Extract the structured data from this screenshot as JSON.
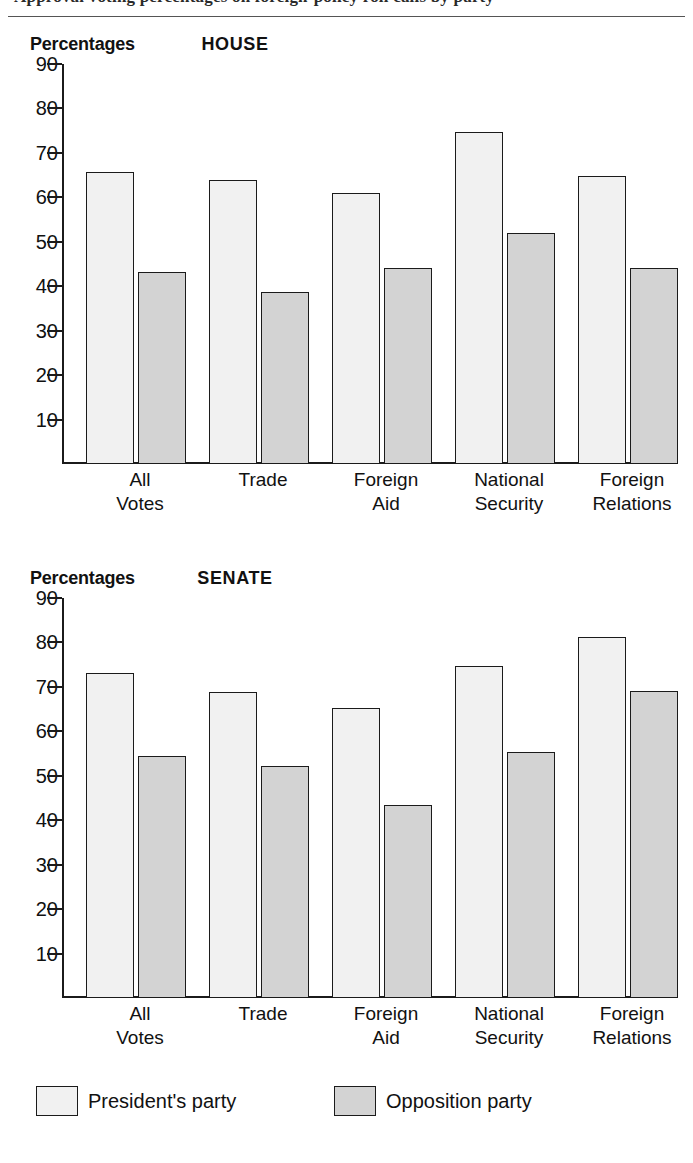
{
  "page": {
    "running_head_partial": "Approval voting percentages on foreign-policy roll calls by party",
    "top_rule": true
  },
  "legend": {
    "items": [
      {
        "key": "president",
        "label": "President's party",
        "color": "#f1f1f1"
      },
      {
        "key": "opposition",
        "label": "Opposition party",
        "color": "#d3d3d3"
      }
    ]
  },
  "axis": {
    "y_title": "Percentages",
    "ticks": [
      90,
      80,
      70,
      60,
      50,
      40,
      30,
      20,
      10
    ],
    "min": 0,
    "max": 90
  },
  "panels": [
    {
      "id": "house",
      "title": "HOUSE",
      "y_title": "Percentages"
    },
    {
      "id": "senate",
      "title": "SENATE",
      "y_title": "Percentages"
    }
  ],
  "chart_data": [
    {
      "type": "bar",
      "title": "HOUSE",
      "xlabel": "",
      "ylabel": "Percentages",
      "ylim": [
        0,
        90
      ],
      "yticks": [
        10,
        20,
        30,
        40,
        50,
        60,
        70,
        80,
        90
      ],
      "grid": false,
      "legend_position": "bottom",
      "categories": [
        "All Votes",
        "Trade",
        "Foreign Aid",
        "National Security",
        "Foreign Relations"
      ],
      "series": [
        {
          "name": "President's party",
          "values": [
            65.7,
            63.8,
            61.0,
            74.8,
            64.8
          ]
        },
        {
          "name": "Opposition party",
          "values": [
            43.1,
            38.7,
            44.0,
            52.0,
            44.1
          ]
        }
      ]
    },
    {
      "type": "bar",
      "title": "SENATE",
      "xlabel": "",
      "ylabel": "Percentages",
      "ylim": [
        0,
        90
      ],
      "yticks": [
        10,
        20,
        30,
        40,
        50,
        60,
        70,
        80,
        90
      ],
      "grid": false,
      "legend_position": "bottom",
      "categories": [
        "All Votes",
        "Trade",
        "Foreign Aid",
        "National Security",
        "Foreign Relations"
      ],
      "series": [
        {
          "name": "President's party",
          "values": [
            73.1,
            68.9,
            65.2,
            74.8,
            81.2
          ]
        },
        {
          "name": "Opposition party",
          "values": [
            54.4,
            52.3,
            43.4,
            55.3,
            69.0
          ]
        }
      ]
    }
  ]
}
